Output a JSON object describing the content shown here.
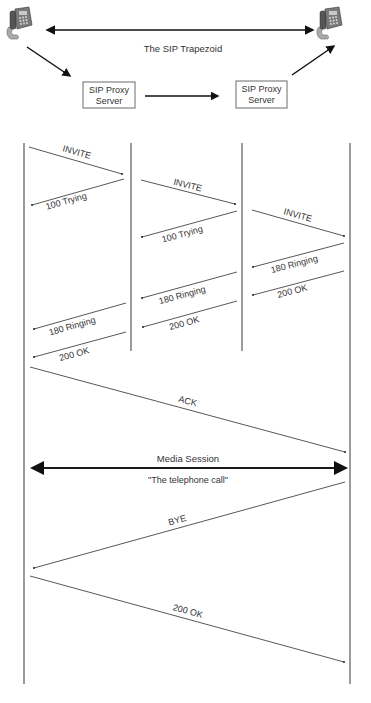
{
  "trapezoid": {
    "title": "The SIP Trapezoid",
    "nodes": [
      {
        "id": "phone-left",
        "type": "phone-icon"
      },
      {
        "id": "proxy-1",
        "label_line1": "SIP Proxy",
        "label_line2": "Server"
      },
      {
        "id": "proxy-2",
        "label_line1": "SIP Proxy",
        "label_line2": "Server"
      },
      {
        "id": "phone-right",
        "type": "phone-icon"
      }
    ],
    "edges": [
      {
        "from": "phone-left",
        "to": "phone-right",
        "style": "bidirectional"
      },
      {
        "from": "phone-left",
        "to": "proxy-1"
      },
      {
        "from": "proxy-1",
        "to": "proxy-2"
      },
      {
        "from": "proxy-2",
        "to": "phone-right"
      }
    ]
  },
  "sequence": {
    "lifelines": [
      "User Agent A",
      "Proxy 1",
      "Proxy 2",
      "User Agent B"
    ],
    "messages": [
      {
        "label": "INVITE",
        "from": 0,
        "to": 1
      },
      {
        "label": "100 Trying",
        "from": 1,
        "to": 0
      },
      {
        "label": "INVITE",
        "from": 1,
        "to": 2
      },
      {
        "label": "100 Trying",
        "from": 2,
        "to": 1
      },
      {
        "label": "INVITE",
        "from": 2,
        "to": 3
      },
      {
        "label": "180 Ringing",
        "from": 3,
        "to": 2
      },
      {
        "label": "200 OK",
        "from": 3,
        "to": 2
      },
      {
        "label": "180 Ringing",
        "from": 2,
        "to": 1
      },
      {
        "label": "200 OK",
        "from": 2,
        "to": 1
      },
      {
        "label": "180 Ringing",
        "from": 1,
        "to": 0
      },
      {
        "label": "200 OK",
        "from": 1,
        "to": 0
      },
      {
        "label": "ACK",
        "from": 0,
        "to": 3
      },
      {
        "label": "BYE",
        "from": 3,
        "to": 0
      },
      {
        "label": "200 OK",
        "from": 0,
        "to": 3
      }
    ],
    "media_session": {
      "label": "Media Session",
      "sublabel": "\"The telephone call\""
    }
  }
}
